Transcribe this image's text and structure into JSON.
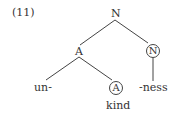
{
  "example_number": "(11)",
  "tree": {
    "root": {
      "label": "N"
    },
    "left": {
      "label": "A"
    },
    "right": {
      "label": "N",
      "circled": true
    },
    "left_left": {
      "label": "un-"
    },
    "left_right": {
      "label": "A",
      "circled": true
    },
    "left_right_word": {
      "label": "kind"
    },
    "right_child": {
      "label": "-ness"
    }
  },
  "colors": {
    "line": "#444444",
    "text": "#333333",
    "background": "#ffffff"
  }
}
